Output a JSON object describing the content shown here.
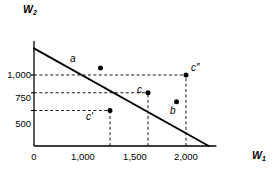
{
  "chart_data": {
    "type": "line",
    "title": "",
    "xlabel": "W1",
    "ylabel": "W2",
    "xlabel_display": "W",
    "xlabel_sub": "1",
    "ylabel_display": "W",
    "ylabel_sub": "2",
    "xlim": [
      0,
      2400
    ],
    "ylim": [
      0,
      1450
    ],
    "grid": false,
    "legend": null,
    "x_ticks": [
      {
        "value": 0,
        "label": "0"
      },
      {
        "value": 1000,
        "label": "1,000"
      },
      {
        "value": 1500,
        "label": "1,500"
      },
      {
        "value": 2000,
        "label": "2,000"
      }
    ],
    "y_ticks": [
      {
        "value": 500,
        "label": "500"
      },
      {
        "value": 750,
        "label": "750"
      },
      {
        "value": 1000,
        "label": "1,000"
      }
    ],
    "series": [
      {
        "name": "budget-line",
        "type": "line",
        "x": [
          0,
          2300
        ],
        "y": [
          1375,
          0
        ],
        "slope": -0.6,
        "intercept": 1375,
        "style": "solid",
        "color": "#000000"
      }
    ],
    "points": [
      {
        "id": "a",
        "label": "a",
        "x": 875,
        "y": 1100,
        "on_line": true,
        "label_pos": "above"
      },
      {
        "id": "c",
        "label": "c",
        "x": 1500,
        "y": 750,
        "on_line": true,
        "label_pos": "above-right"
      },
      {
        "id": "b",
        "label": "b",
        "x": 1875,
        "y": 625,
        "on_line": true,
        "label_pos": "above"
      },
      {
        "id": "cp",
        "label": "c′",
        "x": 1000,
        "y": 500,
        "on_line": false,
        "label_pos": "above-right"
      },
      {
        "id": "cpp",
        "label": "c″",
        "x": 2000,
        "y": 1000,
        "on_line": false,
        "label_pos": "right"
      }
    ],
    "guides": [
      {
        "point": "cp",
        "orientation": "horizontal",
        "from_x": 0,
        "to_x": 1000,
        "y": 500,
        "style": "dashed"
      },
      {
        "point": "cp",
        "orientation": "vertical",
        "x": 1000,
        "from_y": 0,
        "to_y": 500,
        "style": "dashed"
      },
      {
        "point": "c",
        "orientation": "horizontal",
        "from_x": 0,
        "to_x": 1500,
        "y": 750,
        "style": "dashed"
      },
      {
        "point": "c",
        "orientation": "vertical",
        "x": 1500,
        "from_y": 0,
        "to_y": 750,
        "style": "dashed"
      },
      {
        "point": "cpp",
        "orientation": "horizontal",
        "from_x": 0,
        "to_x": 2000,
        "y": 1000,
        "style": "dashed"
      },
      {
        "point": "cpp",
        "orientation": "vertical",
        "x": 2000,
        "from_y": 0,
        "to_y": 1000,
        "style": "dashed"
      }
    ],
    "colors": {
      "axis": "#000000",
      "line": "#000000",
      "guide": "#000000",
      "point": "#000000",
      "background": "#ffffff"
    }
  }
}
